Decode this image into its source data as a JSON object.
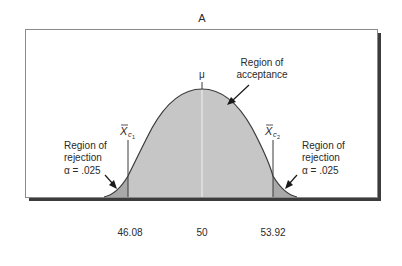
{
  "figure": {
    "panel_label": "A",
    "mu_label": "μ",
    "critical_lower": {
      "symbol": "X",
      "subscript": "c",
      "subsubscript": "1",
      "value_label": "46.08"
    },
    "critical_upper": {
      "symbol": "X",
      "subscript": "c",
      "subsubscript": "2",
      "value_label": "53.92"
    },
    "mean_value_label": "50",
    "acceptance_label": {
      "line1": "Region of",
      "line2": "acceptance"
    },
    "rejection_left_label": {
      "line1": "Region of",
      "line2": "rejection",
      "line3": "α = .025"
    },
    "rejection_right_label": {
      "line1": "Region of",
      "line2": "rejection",
      "line3": "α = .025"
    },
    "colors": {
      "acceptance_fill": "#c6c6c6",
      "rejection_fill": "#a9a9a9",
      "curve_stroke": "#3a3a3a",
      "frame_stroke": "#8a8a8a",
      "shadow": "#3c3c3c",
      "mean_line": "#f2f2f2"
    }
  }
}
